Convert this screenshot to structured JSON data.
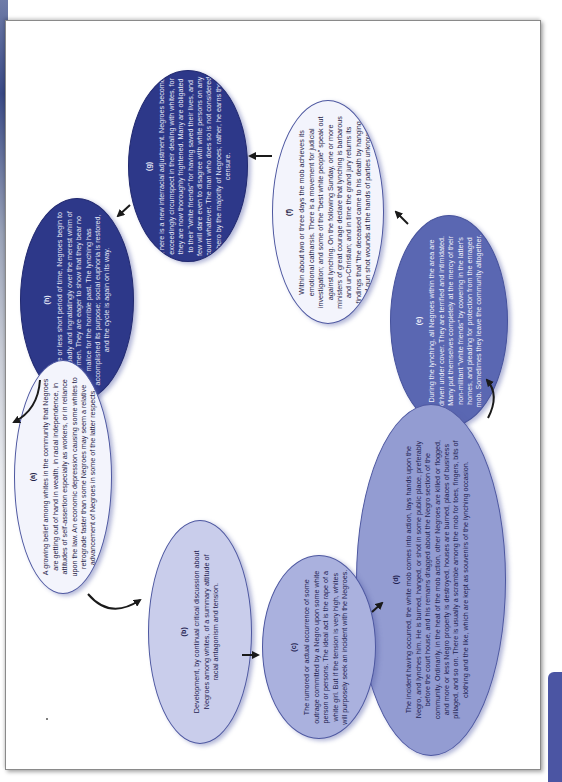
{
  "diagram": {
    "type": "cycle",
    "orientation": "rotated-90-counterclockwise",
    "colors": {
      "dark": "#2d3889",
      "mid": "#5a67b2",
      "midlight": "#939cd2",
      "lavender": "#aab1de",
      "lightlav": "#c9cdeb",
      "pale": "#f3f4fc",
      "arrow": "#1a1a1a",
      "side_tab": "#4b55a3"
    },
    "nodes": [
      {
        "id": "a",
        "label": "(a)",
        "text": "A growing belief among whites in the community that Negroes are getting out of hand in wealth, in racial independence, in attitudes of self-assertion especially as workers, or in reliance upon the law. An economic depression causing some whites to retrograde faster than some Negroes may seem a relative advancement of Negroes in some of the latter respects."
      },
      {
        "id": "b",
        "label": "(b)",
        "text": "Development, by continual critical discussion about Negroes among whites, of a summary attitude of racial antagonism and tension."
      },
      {
        "id": "c",
        "label": "(c)",
        "text": "The rumored or actual occurrence of some outrage committed by a Negro upon some white person or persons. The ideal act is the rape of a white girl. But if the tension is very high, whites will purposely seek an incident with the Negroes."
      },
      {
        "id": "d",
        "label": "(d)",
        "text": "The incident having occurred, the white mob comes into action, lays hands upon the Negro, and lynches him. He is burned, hanged, or shot in some public place, preferably before the court house, and his remains dragged about the Negro section of the community. Ordinarily, in the heat of the mob action, other Negroes are killed or flogged, and more or less Negro property is destroyed, houses are burned, places of business pillaged, and so on. There is usually a scramble among the mob for toes, fingers, bits of clothing and the like, which are kept as souvenirs of the lynching occasion."
      },
      {
        "id": "e",
        "label": "(e)",
        "text": "During the lynching, all Negroes within the area are driven under cover. They are terrified and intimidated. Many put themselves completely at the mercy of their non-militant \"white friends\" by cowering in the latter's homes, and pleading for protection from the enraged mob. Sometimes they leave the community altogether."
      },
      {
        "id": "f",
        "label": "(f)",
        "text": "Within about two or three days the mob achieves its emotional catharsis. There is a movement for judicial investigation; and some of the \"best white people\" speak out against lynching. On the following Sunday, one or more ministers of great courage declare that lynching is barbarous and un-Christian; and in time the grand jury returns its findings that \"the deceased came to his death by hanging and gun shot wounds at the hands of parties unknown.\""
      },
      {
        "id": "g",
        "label": "(g)",
        "text": "There is a new interracial adjustment. Negroes become exceedingly circumspect in their dealing with whites, for they are now thoroughly frightened. Many are obligated to their \"white friends\" for having saved their lives, and few will dare even to disagree with white persons on any count whatever. The man who does so is not considered a hero by the majority of Negroes; rather, he earns their censure."
      },
      {
        "id": "h",
        "label": "(h)",
        "text": "In a more or less short period of time, Negroes begin to smile broadly and ingratiatingly over the merest whim of white men. They are eager to show that they bear no malice for the horrible past. The lynching has accomplished its purpose; social euphoria is restored, and the cycle is again on its way."
      }
    ],
    "edges": [
      {
        "from": "a",
        "to": "b"
      },
      {
        "from": "b",
        "to": "c"
      },
      {
        "from": "c",
        "to": "d"
      },
      {
        "from": "d",
        "to": "e"
      },
      {
        "from": "e",
        "to": "f"
      },
      {
        "from": "f",
        "to": "g"
      },
      {
        "from": "g",
        "to": "h"
      },
      {
        "from": "h",
        "to": "a"
      }
    ]
  }
}
